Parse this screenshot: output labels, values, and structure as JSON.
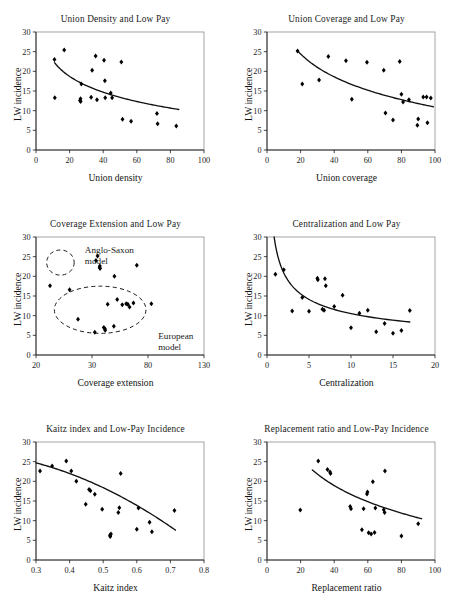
{
  "figure": {
    "panel_count": 6,
    "shared_ylabel": "LW incidence",
    "point_marker": "filled-diamond",
    "line_color": "#111111",
    "frame_color": "#8e8e8e"
  },
  "panels": [
    {
      "id": "union-density",
      "title": "Union Density and Low Pay",
      "xlabel": "Union density",
      "ylabel": "LW incidence"
    },
    {
      "id": "union-coverage",
      "title": "Union Coverage and Low Pay",
      "xlabel": "Union coverage",
      "ylabel": "LW incidence"
    },
    {
      "id": "coverage-extension",
      "title": "Coverage Extension and Low Pay",
      "xlabel": "Coverage extension",
      "ylabel": "LW incidence",
      "annotations": [
        "Anglo-Saxon model",
        "European model"
      ]
    },
    {
      "id": "centralization",
      "title": "Centralization and Low Pay",
      "xlabel": "Centralization",
      "ylabel": "LW incidence"
    },
    {
      "id": "kaitz-index",
      "title": "Kaitz index and Low-Pay Incidence",
      "xlabel": "Kaitz index",
      "ylabel": "LW incidence"
    },
    {
      "id": "replacement-ratio",
      "title": "Replacement ratio and Low-Pay Incidence",
      "xlabel": "Replacement ratio",
      "ylabel": "LW incidence"
    }
  ],
  "chart_data": [
    {
      "type": "scatter",
      "id": "union-density",
      "title": "Union Density and Low Pay",
      "xlabel": "Union density",
      "ylabel": "LW incidence",
      "xlim": [
        0,
        100
      ],
      "ylim": [
        0,
        30
      ],
      "xticks": [
        0,
        20,
        40,
        60,
        80,
        100
      ],
      "yticks": [
        0,
        5,
        10,
        15,
        20,
        25,
        30
      ],
      "grid": false,
      "legend": null,
      "points": [
        [
          11.0,
          23.0
        ],
        [
          11.2,
          13.3
        ],
        [
          16.8,
          25.4
        ],
        [
          26.2,
          12.6
        ],
        [
          26.5,
          13.0
        ],
        [
          26.6,
          12.3
        ],
        [
          27.0,
          16.8
        ],
        [
          32.8,
          13.4
        ],
        [
          33.4,
          20.3
        ],
        [
          35.5,
          23.9
        ],
        [
          36.3,
          12.8
        ],
        [
          40.5,
          22.8
        ],
        [
          41.2,
          13.3
        ],
        [
          41.0,
          17.6
        ],
        [
          44.5,
          14.5
        ],
        [
          45.3,
          13.3
        ],
        [
          50.8,
          22.4
        ],
        [
          51.5,
          7.8
        ],
        [
          56.6,
          7.3
        ],
        [
          72.0,
          9.3
        ],
        [
          72.4,
          6.7
        ],
        [
          83.5,
          6.1
        ]
      ],
      "fit_curve": {
        "kind": "logarithmic-decay",
        "xrange": [
          11.0,
          85.0
        ],
        "yrange": [
          22.2,
          10.3
        ]
      }
    },
    {
      "type": "scatter",
      "id": "union-coverage",
      "title": "Union Coverage and Low Pay",
      "xlabel": "Union coverage",
      "ylabel": "LW incidence",
      "xlim": [
        0,
        100
      ],
      "ylim": [
        0,
        30
      ],
      "xticks": [
        0,
        20,
        40,
        60,
        80,
        100
      ],
      "yticks": [
        0,
        5,
        10,
        15,
        20,
        25,
        30
      ],
      "grid": false,
      "legend": null,
      "points": [
        [
          18.2,
          25.2
        ],
        [
          21.0,
          16.8
        ],
        [
          31.0,
          17.8
        ],
        [
          36.5,
          23.8
        ],
        [
          47.0,
          22.7
        ],
        [
          50.5,
          12.9
        ],
        [
          59.5,
          22.3
        ],
        [
          69.5,
          20.3
        ],
        [
          70.5,
          9.4
        ],
        [
          75.0,
          7.6
        ],
        [
          79.0,
          22.5
        ],
        [
          80.0,
          14.2
        ],
        [
          81.0,
          12.2
        ],
        [
          84.5,
          12.8
        ],
        [
          89.5,
          6.3
        ],
        [
          90.0,
          7.9
        ],
        [
          93.0,
          13.5
        ],
        [
          95.5,
          6.9
        ],
        [
          95.0,
          13.5
        ],
        [
          97.5,
          13.2
        ]
      ],
      "fit_curve": {
        "kind": "logarithmic-decay",
        "xrange": [
          18.2,
          99.0
        ],
        "yrange": [
          25.2,
          11.0
        ]
      }
    },
    {
      "type": "scatter",
      "id": "coverage-extension",
      "title": "Coverage Extension and Low Pay",
      "xlabel": "Coverage extension",
      "ylabel": "LW incidence",
      "xlim": [
        20,
        130
      ],
      "ylim": [
        0,
        30
      ],
      "xticks": [
        20,
        30,
        80,
        130
      ],
      "yticks": [
        0,
        5,
        10,
        15,
        20,
        25,
        30
      ],
      "grid": false,
      "legend": null,
      "annotations": [
        {
          "text": "Anglo-Saxon model",
          "x": 52,
          "y": 26
        },
        {
          "text": "European model",
          "x": 100,
          "y": 4
        }
      ],
      "clusters": [
        {
          "label": "Anglo-Saxon model",
          "cx": 36,
          "cy": 23.5,
          "rx": 9,
          "ry": 3.2
        },
        {
          "label": "European model",
          "cx": 62,
          "cy": 11.5,
          "rx": 30,
          "ry": 6.0
        }
      ],
      "points": [
        [
          22.5,
          17.6
        ],
        [
          26.0,
          16.6
        ],
        [
          27.5,
          9.1
        ],
        [
          32.5,
          5.8
        ],
        [
          33.5,
          24.0
        ],
        [
          35.0,
          25.2
        ],
        [
          36.8,
          22.3
        ],
        [
          37.2,
          22.0
        ],
        [
          37.0,
          22.6
        ],
        [
          40.5,
          7.0
        ],
        [
          41.5,
          6.7
        ],
        [
          41.8,
          6.3
        ],
        [
          44.0,
          12.9
        ],
        [
          50.0,
          20.0
        ],
        [
          49.5,
          7.3
        ],
        [
          52.5,
          14.1
        ],
        [
          57.0,
          12.8
        ],
        [
          60.5,
          13.0
        ],
        [
          62.0,
          12.9
        ],
        [
          63.5,
          12.2
        ],
        [
          67.0,
          13.2
        ],
        [
          70.0,
          22.8
        ],
        [
          83.0,
          13.0
        ]
      ]
    },
    {
      "type": "scatter",
      "id": "centralization",
      "title": "Centralization and Low Pay",
      "xlabel": "Centralization",
      "ylabel": "LW incidence",
      "xlim": [
        0,
        20
      ],
      "ylim": [
        0,
        30
      ],
      "xticks": [
        0,
        5,
        10,
        15,
        20
      ],
      "yticks": [
        0,
        5,
        10,
        15,
        20,
        25,
        30
      ],
      "grid": false,
      "legend": null,
      "points": [
        [
          1.0,
          20.5
        ],
        [
          2.0,
          21.7
        ],
        [
          3.0,
          11.2
        ],
        [
          4.2,
          14.6
        ],
        [
          5.0,
          11.1
        ],
        [
          6.0,
          19.5
        ],
        [
          6.05,
          19.1
        ],
        [
          6.9,
          19.4
        ],
        [
          7.0,
          17.6
        ],
        [
          6.6,
          11.6
        ],
        [
          6.8,
          11.4
        ],
        [
          8.0,
          12.3
        ],
        [
          9.0,
          15.2
        ],
        [
          10.0,
          6.9
        ],
        [
          11.0,
          10.6
        ],
        [
          12.0,
          11.4
        ],
        [
          13.0,
          5.9
        ],
        [
          14.0,
          8.0
        ],
        [
          15.0,
          5.5
        ],
        [
          16.0,
          6.2
        ],
        [
          17.0,
          11.3
        ]
      ],
      "fit_curve": {
        "kind": "power-decay",
        "xrange": [
          0.85,
          17.0
        ],
        "yrange": [
          30.0,
          8.4
        ]
      }
    },
    {
      "type": "scatter",
      "id": "kaitz-index",
      "title": "Kaitz index and Low-Pay Incidence",
      "xlabel": "Kaitz index",
      "ylabel": "LW incidence",
      "xlim": [
        0.3,
        0.8
      ],
      "ylim": [
        0,
        30
      ],
      "xticks": [
        0.3,
        0.4,
        0.5,
        0.6,
        0.7,
        0.8
      ],
      "yticks": [
        0,
        5,
        10,
        15,
        20,
        25,
        30
      ],
      "grid": false,
      "legend": null,
      "points": [
        [
          0.312,
          22.6
        ],
        [
          0.348,
          23.9
        ],
        [
          0.39,
          25.2
        ],
        [
          0.405,
          22.6
        ],
        [
          0.42,
          20.0
        ],
        [
          0.448,
          14.2
        ],
        [
          0.462,
          17.6
        ],
        [
          0.458,
          17.9
        ],
        [
          0.475,
          16.7
        ],
        [
          0.497,
          12.9
        ],
        [
          0.52,
          6.3
        ],
        [
          0.521,
          6.0
        ],
        [
          0.523,
          6.6
        ],
        [
          0.548,
          13.3
        ],
        [
          0.545,
          12.1
        ],
        [
          0.552,
          22.0
        ],
        [
          0.6,
          7.8
        ],
        [
          0.605,
          13.2
        ],
        [
          0.638,
          9.6
        ],
        [
          0.645,
          7.2
        ],
        [
          0.712,
          12.6
        ]
      ],
      "fit_curve": {
        "kind": "quadratic-decay",
        "xrange": [
          0.3,
          0.715
        ],
        "yrange": [
          24.7,
          7.6
        ]
      }
    },
    {
      "type": "scatter",
      "id": "replacement-ratio",
      "title": "Replacement ratio and Low-Pay Incidence",
      "xlabel": "Replacement ratio",
      "ylabel": "LW incidence",
      "xlim": [
        0,
        100
      ],
      "ylim": [
        0,
        30
      ],
      "xticks": [
        0,
        20,
        40,
        60,
        80,
        100
      ],
      "yticks": [
        0,
        5,
        10,
        15,
        20,
        25,
        30
      ],
      "grid": false,
      "legend": null,
      "points": [
        [
          19.8,
          12.7
        ],
        [
          30.5,
          25.2
        ],
        [
          36.0,
          23.0
        ],
        [
          37.5,
          22.4
        ],
        [
          37.8,
          22.0
        ],
        [
          49.5,
          13.6
        ],
        [
          50.0,
          13.0
        ],
        [
          56.5,
          7.7
        ],
        [
          57.5,
          13.0
        ],
        [
          59.5,
          16.8
        ],
        [
          59.8,
          17.3
        ],
        [
          60.5,
          6.9
        ],
        [
          62.0,
          6.6
        ],
        [
          63.0,
          19.9
        ],
        [
          64.0,
          7.0
        ],
        [
          64.5,
          13.2
        ],
        [
          69.5,
          12.8
        ],
        [
          70.0,
          12.1
        ],
        [
          70.2,
          22.6
        ],
        [
          80.0,
          6.1
        ],
        [
          90.0,
          9.2
        ]
      ],
      "fit_curve": {
        "kind": "logarithmic-decay",
        "xrange": [
          27.0,
          92.0
        ],
        "yrange": [
          22.9,
          10.5
        ]
      }
    }
  ]
}
